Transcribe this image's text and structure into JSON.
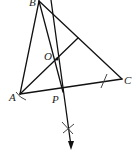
{
  "diagram": {
    "title": "",
    "type": "geometry-construction",
    "points": [
      {
        "name": "B",
        "label": "B",
        "x": 39,
        "y": 1
      },
      {
        "name": "A",
        "label": "A",
        "x": 20,
        "y": 94
      },
      {
        "name": "C",
        "label": "C",
        "x": 122,
        "y": 79
      },
      {
        "name": "O",
        "label": "O",
        "x": 57,
        "y": 59
      },
      {
        "name": "P",
        "label": "P",
        "x": 63,
        "y": 88
      }
    ],
    "segments": [
      {
        "from": "A",
        "to": "B"
      },
      {
        "from": "B",
        "to": "C"
      },
      {
        "from": "A",
        "to": "C"
      },
      {
        "from": "A",
        "to": "foot-on-BC"
      },
      {
        "from": "B",
        "to": "P"
      }
    ],
    "construction": {
      "perpendicular_bisector_ray": "from top through O and P to arrow below",
      "arc_marks": [
        "near A",
        "on AC near C",
        "cross mark below P"
      ]
    },
    "colors": {
      "line": "#111111",
      "background": "#ffffff"
    }
  }
}
